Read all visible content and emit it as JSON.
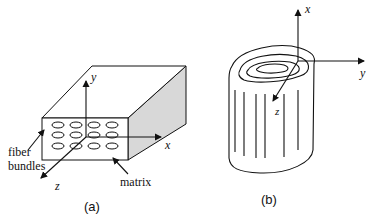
{
  "figure_a": {
    "caption": "(a)",
    "axes": {
      "x": "x",
      "y": "y",
      "z": "z"
    },
    "labels": {
      "fiber_line1": "fiber",
      "fiber_line2": "bundles",
      "matrix": "matrix"
    },
    "bundle_grid": {
      "rows": 3,
      "cols": 4
    }
  },
  "figure_b": {
    "caption": "(b)",
    "axes": {
      "x": "x",
      "y": "y",
      "z": "z"
    }
  },
  "colors": {
    "stroke": "#111111",
    "shade": "#d8d8d8",
    "background": "#ffffff"
  }
}
